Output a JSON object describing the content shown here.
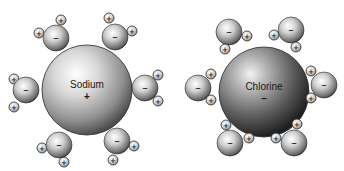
{
  "diagram": {
    "title": "",
    "ions": [
      {
        "name": "Sodium",
        "charge": "+",
        "center": [
          87,
          90
        ],
        "radius": 45,
        "shade": "light",
        "waters": [
          {
            "o": [
              56,
              38
            ],
            "h": [
              [
                39,
                33
              ],
              [
                61,
                20
              ]
            ],
            "o_sign": "–"
          },
          {
            "o": [
              115,
              37
            ],
            "h": [
              [
                109,
                18
              ],
              [
                132,
                31
              ]
            ],
            "o_sign": "–"
          },
          {
            "o": [
              26,
              90
            ],
            "h": [
              [
                14,
                79
              ],
              [
                14,
                107
              ]
            ],
            "o_sign": "–"
          },
          {
            "o": [
              145,
              88
            ],
            "h": [
              [
                158,
                75
              ],
              [
                158,
                101
              ]
            ],
            "o_sign": "–"
          },
          {
            "o": [
              59,
              145
            ],
            "h": [
              [
                42,
                148
              ],
              [
                64,
                162
              ]
            ],
            "o_sign": "–"
          },
          {
            "o": [
              117,
              141
            ],
            "h": [
              [
                134,
                146
              ],
              [
                113,
                160
              ]
            ],
            "o_sign": "–"
          }
        ]
      },
      {
        "name": "Chlorine",
        "charge": "–",
        "center": [
          264,
          92
        ],
        "radius": 45,
        "shade": "dark",
        "waters": [
          {
            "o": [
              229,
              32
            ],
            "h": [
              [
                247,
                36
              ],
              [
                225,
                49
              ]
            ],
            "o_sign": "–"
          },
          {
            "o": [
              291,
              30
            ],
            "h": [
              [
                274,
                35
              ],
              [
                296,
                47
              ]
            ],
            "o_sign": "–"
          },
          {
            "o": [
              198,
              88
            ],
            "h": [
              [
                211,
                74
              ],
              [
                211,
                100
              ]
            ],
            "o_sign": "–"
          },
          {
            "o": [
              324,
              85
            ],
            "h": [
              [
                311,
                71
              ],
              [
                311,
                98
              ]
            ],
            "o_sign": "–"
          },
          {
            "o": [
              230,
              143
            ],
            "h": [
              [
                226,
                125
              ],
              [
                249,
                138
              ]
            ],
            "o_sign": "–"
          },
          {
            "o": [
              294,
              143
            ],
            "h": [
              [
                276,
                138
              ],
              [
                297,
                124
              ]
            ],
            "o_sign": "–"
          }
        ]
      }
    ],
    "water_oxygen_radius": 13,
    "water_hydrogen_radius": 5,
    "hydrogen_sign": "+",
    "colors": {
      "background": "#ffffff",
      "outline": "#2a2a2a",
      "text": "#1a1a1a"
    }
  }
}
